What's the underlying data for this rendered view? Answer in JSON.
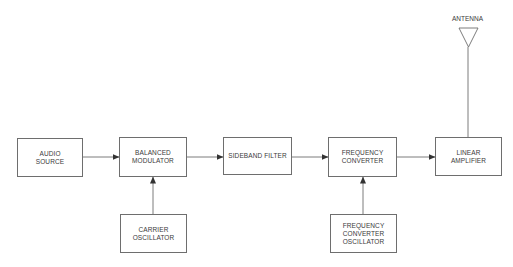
{
  "diagram": {
    "blocks": [
      {
        "id": "audio_source",
        "lines": [
          "AUDIO",
          "SOURCE"
        ]
      },
      {
        "id": "balanced_modulator",
        "lines": [
          "BALANCED",
          "MODULATOR"
        ]
      },
      {
        "id": "sideband_filter",
        "lines": [
          "SIDEBAND FILTER"
        ]
      },
      {
        "id": "frequency_converter",
        "lines": [
          "FREQUENCY",
          "CONVERTER"
        ]
      },
      {
        "id": "linear_amplifier",
        "lines": [
          "LINEAR",
          "AMPLIFIER"
        ]
      },
      {
        "id": "carrier_oscillator",
        "lines": [
          "CARRIER",
          "OSCILLATOR"
        ]
      },
      {
        "id": "frequency_converter_oscillator",
        "lines": [
          "FREQUENCY",
          "CONVERTER",
          "OSCILLATOR"
        ]
      }
    ],
    "antenna": {
      "label": "ANTENNA"
    },
    "connections": [
      {
        "from": "audio_source",
        "to": "balanced_modulator"
      },
      {
        "from": "carrier_oscillator",
        "to": "balanced_modulator"
      },
      {
        "from": "balanced_modulator",
        "to": "sideband_filter"
      },
      {
        "from": "sideband_filter",
        "to": "frequency_converter"
      },
      {
        "from": "frequency_converter_oscillator",
        "to": "frequency_converter"
      },
      {
        "from": "frequency_converter",
        "to": "linear_amplifier"
      },
      {
        "from": "linear_amplifier",
        "to": "antenna"
      }
    ],
    "colors": {
      "line": "#6e6e6e",
      "text": "#3a3a3a",
      "background": "#ffffff"
    }
  }
}
